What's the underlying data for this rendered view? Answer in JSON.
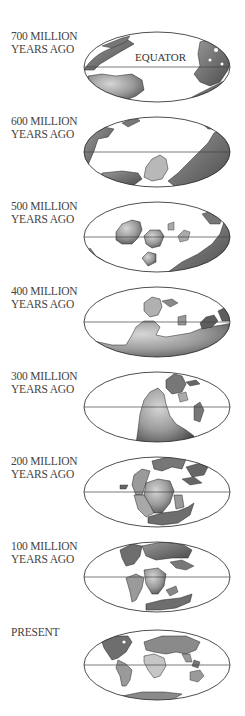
{
  "figure": {
    "equator_label": "EQUATOR",
    "panels": [
      {
        "line1": "700 MILLION",
        "line2": "YEARS AGO",
        "top": 30
      },
      {
        "line1": "600 MILLION",
        "line2": "YEARS AGO",
        "top": 115
      },
      {
        "line1": "500 MILLION",
        "line2": "YEARS AGO",
        "top": 200
      },
      {
        "line1": "400 MILLION",
        "line2": "YEARS AGO",
        "top": 285
      },
      {
        "line1": "300 MILLION",
        "line2": "YEARS AGO",
        "top": 370
      },
      {
        "line1": "200 MILLION",
        "line2": "YEARS AGO",
        "top": 455
      },
      {
        "line1": "100 MILLION",
        "line2": "YEARS AGO",
        "top": 540
      },
      {
        "line1": "PRESENT",
        "line2": "",
        "top": 626
      }
    ]
  },
  "colors": {
    "land_dark": "#5f5f5f",
    "land_mid": "#8a8a8a",
    "land_light": "#bdbdbd",
    "outline": "#222222",
    "ocean": "#ffffff"
  }
}
